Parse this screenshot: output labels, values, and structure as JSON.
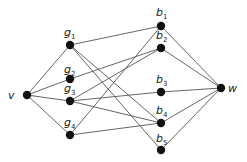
{
  "diagram": {
    "type": "graph",
    "nodes": [
      {
        "id": "v",
        "label": "v",
        "sub": "",
        "x": 27,
        "y": 95,
        "lx": 8,
        "ly": 99,
        "anchor": "start"
      },
      {
        "id": "g1",
        "label": "g",
        "sub": "1",
        "x": 70,
        "y": 45,
        "lx": 64,
        "ly": 36,
        "anchor": "start"
      },
      {
        "id": "g2",
        "label": "g",
        "sub": "2",
        "x": 70,
        "y": 79,
        "lx": 64,
        "ly": 73,
        "anchor": "start"
      },
      {
        "id": "g3",
        "label": "g",
        "sub": "3",
        "x": 70,
        "y": 101,
        "lx": 64,
        "ly": 92,
        "anchor": "start"
      },
      {
        "id": "g4",
        "label": "g",
        "sub": "4",
        "x": 70,
        "y": 135,
        "lx": 64,
        "ly": 126,
        "anchor": "start"
      },
      {
        "id": "b1",
        "label": "b",
        "sub": "1",
        "x": 161,
        "y": 26,
        "lx": 156,
        "ly": 16,
        "anchor": "start"
      },
      {
        "id": "b2",
        "label": "b",
        "sub": "2",
        "x": 161,
        "y": 48,
        "lx": 156,
        "ly": 39,
        "anchor": "start"
      },
      {
        "id": "b3",
        "label": "b",
        "sub": "3",
        "x": 161,
        "y": 92,
        "lx": 156,
        "ly": 83,
        "anchor": "start"
      },
      {
        "id": "b4",
        "label": "b",
        "sub": "4",
        "x": 161,
        "y": 123,
        "lx": 156,
        "ly": 114,
        "anchor": "start"
      },
      {
        "id": "b5",
        "label": "b",
        "sub": "5",
        "x": 161,
        "y": 150,
        "lx": 156,
        "ly": 142,
        "anchor": "start"
      },
      {
        "id": "w",
        "label": "w",
        "sub": "",
        "x": 221,
        "y": 88,
        "lx": 228,
        "ly": 92,
        "anchor": "start"
      }
    ],
    "edges": [
      [
        "v",
        "g1"
      ],
      [
        "v",
        "g2"
      ],
      [
        "v",
        "g3"
      ],
      [
        "v",
        "g4"
      ],
      [
        "g1",
        "b1"
      ],
      [
        "g1",
        "b4"
      ],
      [
        "g1",
        "b5"
      ],
      [
        "g2",
        "b2"
      ],
      [
        "g3",
        "b2"
      ],
      [
        "g3",
        "b3"
      ],
      [
        "g3",
        "b4"
      ],
      [
        "g4",
        "b1"
      ],
      [
        "g4",
        "b4"
      ],
      [
        "b1",
        "w"
      ],
      [
        "b2",
        "w"
      ],
      [
        "b3",
        "w"
      ],
      [
        "b4",
        "w"
      ],
      [
        "b5",
        "w"
      ]
    ]
  }
}
